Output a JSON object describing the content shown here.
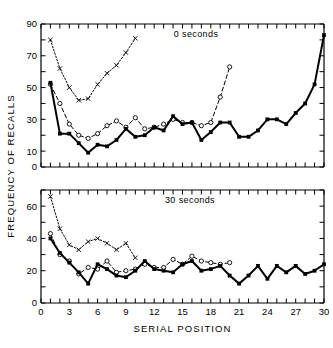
{
  "figure": {
    "ylabel": "FREQUENCY OF RECALLS",
    "xlabel": "SERIAL POSITION"
  },
  "chart_data": [
    {
      "type": "line",
      "title": "0 seconds",
      "panel": "top",
      "xlabel": "",
      "ylabel": "FREQUENCY OF RECALLS",
      "xlim": [
        0,
        30
      ],
      "ylim": [
        0,
        90
      ],
      "xticks": [
        0,
        1,
        2,
        3,
        4,
        5,
        6,
        7,
        8,
        9,
        10,
        11,
        12,
        13,
        14,
        15,
        16,
        17,
        18,
        19,
        20,
        21,
        22,
        23,
        24,
        25,
        26,
        27,
        28,
        29,
        30
      ],
      "xticklabels": [
        "0",
        "",
        "",
        "3",
        "",
        "",
        "6",
        "",
        "",
        "9",
        "",
        "",
        "12",
        "",
        "",
        "15",
        "",
        "",
        "18",
        "",
        "",
        "21",
        "",
        "",
        "24",
        "",
        "",
        "27",
        "",
        "",
        "30"
      ],
      "yticks": [
        0,
        10,
        20,
        30,
        40,
        50,
        60,
        70,
        80,
        90
      ],
      "yticklabels": [
        "0",
        "10",
        "",
        "30",
        "",
        "50",
        "",
        "70",
        "",
        "90"
      ],
      "grid": false,
      "legend_position": "none",
      "annotations": [
        "0 seconds"
      ],
      "series": [
        {
          "name": "10-item list",
          "marker": "x",
          "linestyle": "dotted",
          "x": [
            1,
            2,
            3,
            4,
            5,
            6,
            7,
            8,
            9,
            10
          ],
          "values": [
            80,
            62,
            50,
            42,
            43,
            52,
            59,
            64,
            72,
            81
          ]
        },
        {
          "name": "20-item list",
          "marker": "open-circle",
          "linestyle": "dashed",
          "x": [
            1,
            2,
            3,
            4,
            5,
            6,
            7,
            8,
            9,
            10,
            11,
            12,
            13,
            14,
            15,
            16,
            17,
            18,
            19,
            20
          ],
          "values": [
            52,
            40,
            27,
            20,
            18,
            21,
            26,
            29,
            25,
            31,
            24,
            25,
            27,
            30,
            28,
            28,
            26,
            28,
            44,
            63
          ]
        },
        {
          "name": "30-item list",
          "marker": "filled-square",
          "linestyle": "solid",
          "x": [
            1,
            2,
            3,
            4,
            5,
            6,
            7,
            8,
            9,
            10,
            11,
            12,
            13,
            14,
            15,
            16,
            17,
            18,
            19,
            20,
            21,
            22,
            23,
            24,
            25,
            26,
            27,
            28,
            29,
            30
          ],
          "values": [
            53,
            21,
            21,
            15,
            9,
            14,
            13,
            17,
            24,
            19,
            20,
            25,
            23,
            32,
            27,
            28,
            17,
            22,
            28,
            28,
            19,
            19,
            23,
            30,
            30,
            27,
            34,
            40,
            52,
            83
          ]
        }
      ]
    },
    {
      "type": "line",
      "title": "30 seconds",
      "panel": "bottom",
      "xlabel": "SERIAL POSITION",
      "ylabel": "FREQUENCY OF RECALLS",
      "xlim": [
        0,
        30
      ],
      "ylim": [
        0,
        70
      ],
      "xticks": [
        0,
        1,
        2,
        3,
        4,
        5,
        6,
        7,
        8,
        9,
        10,
        11,
        12,
        13,
        14,
        15,
        16,
        17,
        18,
        19,
        20,
        21,
        22,
        23,
        24,
        25,
        26,
        27,
        28,
        29,
        30
      ],
      "xticklabels": [
        "0",
        "",
        "",
        "3",
        "",
        "",
        "6",
        "",
        "",
        "9",
        "",
        "",
        "12",
        "",
        "",
        "15",
        "",
        "",
        "18",
        "",
        "",
        "21",
        "",
        "",
        "24",
        "",
        "",
        "27",
        "",
        "",
        "30"
      ],
      "yticks": [
        0,
        10,
        20,
        30,
        40,
        50,
        60,
        70
      ],
      "yticklabels": [
        "0",
        "",
        "20",
        "",
        "40",
        "",
        "60",
        ""
      ],
      "grid": false,
      "legend_position": "none",
      "annotations": [
        "30 seconds"
      ],
      "series": [
        {
          "name": "10-item list",
          "marker": "x",
          "linestyle": "dotted",
          "x": [
            1,
            2,
            3,
            4,
            5,
            6,
            7,
            8,
            9,
            10
          ],
          "values": [
            66,
            46,
            36,
            33,
            38,
            40,
            37,
            33,
            37,
            28
          ]
        },
        {
          "name": "20-item list",
          "marker": "open-circle",
          "linestyle": "dashed",
          "x": [
            1,
            2,
            3,
            4,
            5,
            6,
            7,
            8,
            9,
            10,
            11,
            12,
            13,
            14,
            15,
            16,
            17,
            18,
            19,
            20
          ],
          "values": [
            43,
            30,
            26,
            18,
            22,
            21,
            26,
            19,
            20,
            21,
            24,
            22,
            22,
            27,
            24,
            29,
            26,
            25,
            24,
            25
          ]
        },
        {
          "name": "30-item list",
          "marker": "filled-square",
          "linestyle": "solid",
          "x": [
            1,
            2,
            3,
            4,
            5,
            6,
            7,
            8,
            9,
            10,
            11,
            12,
            13,
            14,
            15,
            16,
            17,
            18,
            19,
            20,
            21,
            22,
            23,
            24,
            25,
            26,
            27,
            28,
            29,
            30
          ],
          "values": [
            40,
            31,
            25,
            19,
            12,
            24,
            21,
            17,
            16,
            20,
            26,
            21,
            20,
            19,
            24,
            26,
            20,
            21,
            23,
            17,
            12,
            17,
            23,
            15,
            23,
            19,
            23,
            18,
            20,
            24
          ]
        }
      ]
    }
  ]
}
